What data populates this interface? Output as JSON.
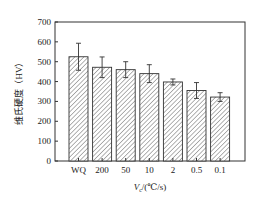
{
  "chart_data": {
    "type": "bar",
    "title": "",
    "xlabel": "V_c/(℃/s)",
    "xlabel_main": "V",
    "xlabel_sub": "c",
    "xlabel_rest": "/(℃/s)",
    "ylabel": "维氏硬度（HV）",
    "categories": [
      "WQ",
      "200",
      "50",
      "10",
      "2",
      "0.5",
      "0.1"
    ],
    "values": [
      525,
      472,
      460,
      440,
      398,
      355,
      322
    ],
    "errors": [
      68,
      52,
      40,
      45,
      15,
      40,
      22
    ],
    "ylim": [
      0,
      700
    ],
    "yticks": [
      0,
      100,
      200,
      300,
      400,
      500,
      600,
      700
    ],
    "grid": false,
    "legend": null,
    "bar_fill": "hatched diagonal",
    "colors": {
      "bar_edge": "#333333",
      "hatch": "#555555",
      "axis": "#333333",
      "background": "#ffffff"
    }
  }
}
